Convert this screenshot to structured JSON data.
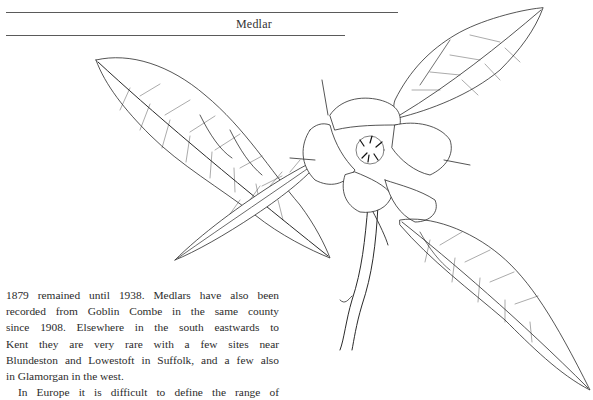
{
  "page": {
    "running_head": "Medlar",
    "paragraphs": [
      {
        "indent": false,
        "lines": [
          "1879 remained until 1938. Medlars have also been",
          "recorded from Goblin Combe in the same county",
          "since 1908. Elsewhere in the south eastwards to",
          "Kent they are very rare with a few sites near",
          "Blundeston and Lowestoft in Suffolk, and a few also",
          "in Glamorgan in the west."
        ]
      },
      {
        "indent": true,
        "lines": [
          "In Europe it is difficult to define the range of"
        ]
      }
    ],
    "figure": {
      "subject": "medlar-branch-illustration",
      "style": "pen-and-ink botanical drawing",
      "parts": [
        "upper-left-leaf",
        "crossing-narrow-leaf",
        "flower",
        "upper-right-leaf",
        "lower-right-leaf",
        "stem"
      ]
    }
  }
}
